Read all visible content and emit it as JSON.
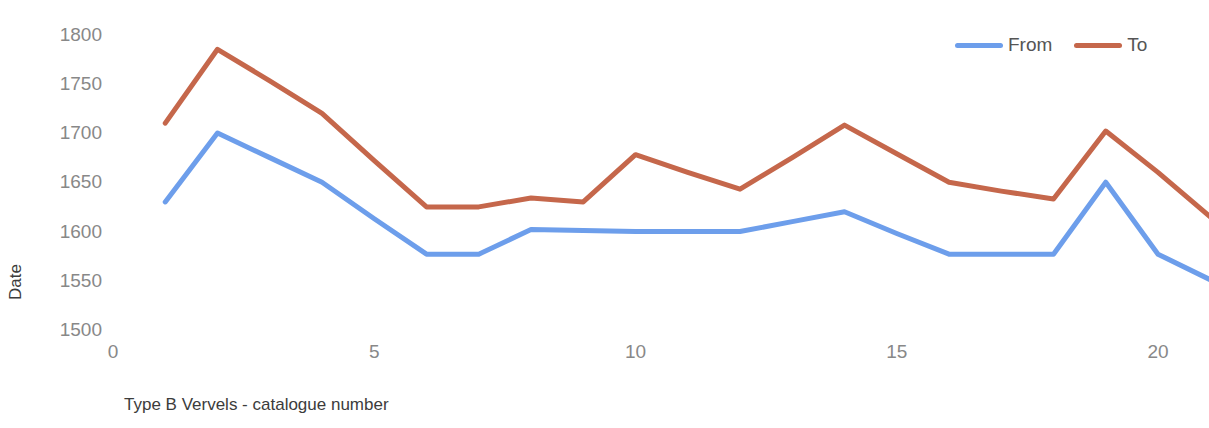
{
  "chart_data": {
    "type": "line",
    "title": "",
    "xlabel": "Type B Vervels - catalogue number",
    "ylabel": "Date",
    "xlim": [
      0,
      21.2
    ],
    "ylim": [
      1500,
      1810
    ],
    "xticks": [
      "0",
      "5",
      "10",
      "15",
      "20"
    ],
    "xtick_values": [
      0,
      5,
      10,
      15,
      20
    ],
    "yticks": [
      "1500",
      "1550",
      "1600",
      "1650",
      "1700",
      "1750",
      "1800"
    ],
    "ytick_values": [
      1500,
      1550,
      1600,
      1650,
      1700,
      1750,
      1800
    ],
    "grid": false,
    "legend_position": "top-right",
    "x": [
      1,
      2,
      3,
      4,
      5,
      6,
      7,
      8,
      9,
      10,
      11,
      12,
      13,
      14,
      15,
      16,
      17,
      18,
      19,
      20,
      21
    ],
    "series": [
      {
        "name": "From",
        "color": "#6d9eeb",
        "values": [
          1630,
          1700,
          1675,
          1650,
          1613,
          1577,
          1577,
          1602,
          1601,
          1600,
          1600,
          1600,
          1610,
          1620,
          1598,
          1577,
          1577,
          1577,
          1650,
          1577,
          1551
        ]
      },
      {
        "name": "To",
        "color": "#c5674b",
        "values": [
          1710,
          1785,
          1753,
          1720,
          1672,
          1625,
          1625,
          1634,
          1630,
          1678,
          1660,
          1643,
          1675,
          1708,
          1679,
          1650,
          1641,
          1633,
          1702,
          1660,
          1615
        ]
      }
    ]
  },
  "legend": {
    "items": [
      {
        "label": "From",
        "color": "#6d9eeb"
      },
      {
        "label": "To",
        "color": "#c5674b"
      }
    ]
  },
  "axes": {
    "y_title": "Date",
    "x_title": "Type B Vervels - catalogue number"
  }
}
